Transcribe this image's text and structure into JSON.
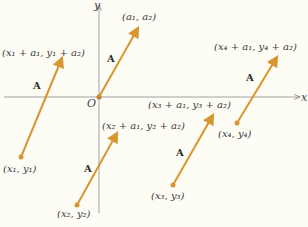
{
  "diagram": {
    "axes": {
      "x_label": "x",
      "y_label": "y",
      "origin_label": "O"
    },
    "vector_name": "A",
    "colors": {
      "vector": "#d9952f",
      "axis": "#888888",
      "background": "#fdfcf5"
    },
    "vectors": [
      {
        "id": "origin",
        "tail_label": "",
        "head_label": "(a₁, a₂)"
      },
      {
        "id": "v1",
        "tail_label": "(x₁, y₁)",
        "head_label": "(x₁ + a₁, y₁ + a₂)"
      },
      {
        "id": "v2",
        "tail_label": "(x₂, y₂)",
        "head_label": "(x₂ + a₁, y₂ + a₂)"
      },
      {
        "id": "v3",
        "tail_label": "(x₃, y₃)",
        "head_label": "(x₃ + a₁, y₃ + a₂)"
      },
      {
        "id": "v4",
        "tail_label": "(x₄, y₄)",
        "head_label": "(x₄ + a₁, y₄ + a₂)"
      }
    ]
  }
}
